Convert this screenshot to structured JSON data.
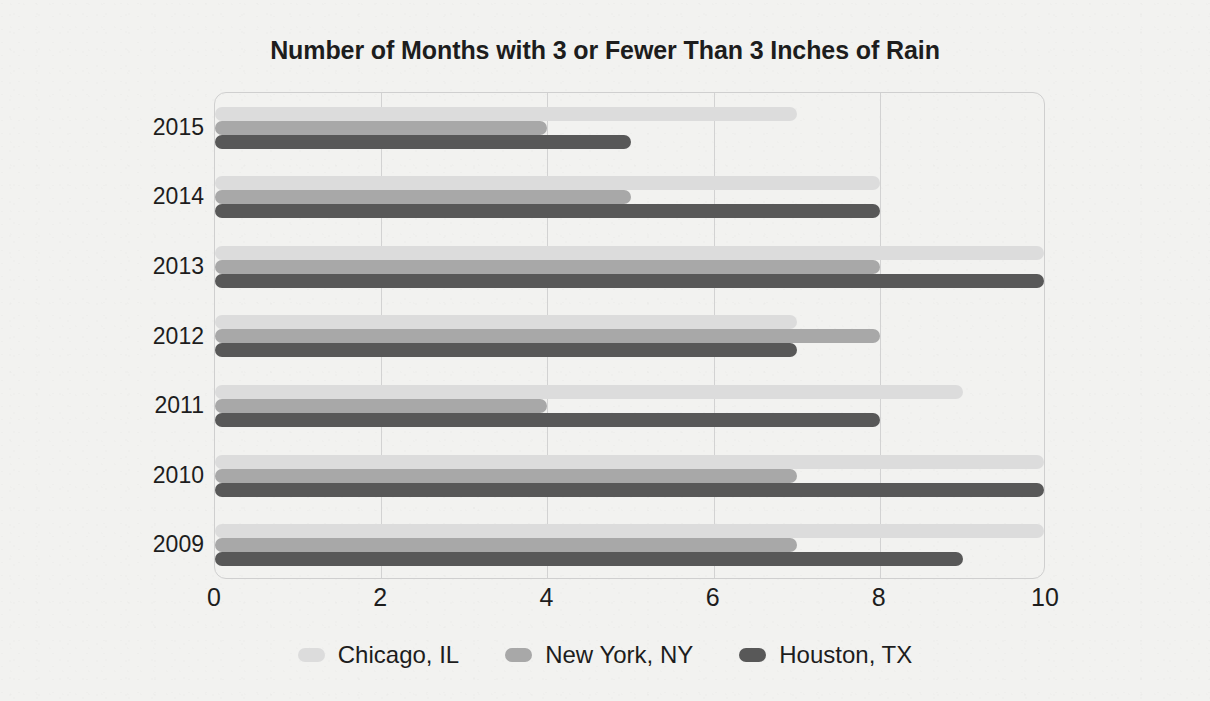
{
  "chart_data": {
    "type": "bar",
    "orientation": "horizontal",
    "title": "Number of Months with 3 or Fewer Than 3 Inches of Rain",
    "xlabel": "",
    "ylabel": "",
    "categories": [
      "2015",
      "2014",
      "2013",
      "2012",
      "2011",
      "2010",
      "2009"
    ],
    "series": [
      {
        "name": "Chicago, IL",
        "color": "#dcdcdc",
        "values": [
          7,
          8,
          10,
          7,
          9,
          10,
          10
        ]
      },
      {
        "name": "New York, NY",
        "color": "#a8a8a8",
        "values": [
          4,
          5,
          8,
          8,
          4,
          7,
          7
        ]
      },
      {
        "name": "Houston, TX",
        "color": "#585858",
        "values": [
          5,
          8,
          10,
          7,
          8,
          10,
          9
        ]
      }
    ],
    "xlim": [
      0,
      10
    ],
    "xticks": [
      "0",
      "2",
      "4",
      "6",
      "8",
      "10"
    ],
    "xtick_values": [
      0,
      2,
      4,
      6,
      8,
      10
    ],
    "gridlines": [
      2,
      4,
      6,
      8
    ],
    "grid": true,
    "legend_position": "bottom",
    "background_color": "#f2f2f0",
    "plot_border_color": "#cfcfcf"
  }
}
